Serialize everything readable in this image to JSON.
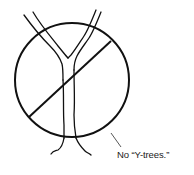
{
  "figure": {
    "caption": "No “Y-trees.”",
    "colors": {
      "stroke": "#111111",
      "background": "#ffffff",
      "leader": "#444444"
    },
    "icons": [
      "y-tree-icon",
      "prohibition-sign-icon"
    ]
  }
}
